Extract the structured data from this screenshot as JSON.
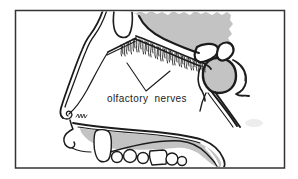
{
  "figure": {
    "label": "olfactory nerves"
  },
  "colors": {
    "background": "#ffffff",
    "frame": "#333333",
    "line": "#1c1c1c",
    "shade": "#c3c3c3",
    "smudge": "#ededed",
    "text": "#1a1a1a"
  }
}
